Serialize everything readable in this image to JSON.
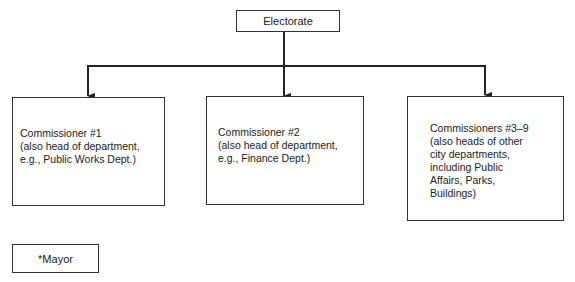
{
  "diagram": {
    "root": {
      "label": "Electorate"
    },
    "children": [
      {
        "title": "Commissioner #1",
        "lines": [
          "(also head of department,",
          "e.g., Public Works Dept.)"
        ]
      },
      {
        "title": "Commissioner #2",
        "lines": [
          "(also head of department,",
          "e.g., Finance Dept.)"
        ]
      },
      {
        "title": "Commissioners #3–9",
        "lines": [
          "(also heads of other",
          "city departments,",
          "including Public",
          "Affairs, Parks,",
          "Buildings)"
        ]
      }
    ],
    "footnote_box": {
      "label": "*Mayor"
    }
  }
}
